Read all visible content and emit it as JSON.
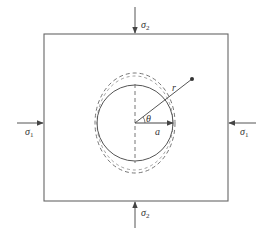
{
  "diagram": {
    "type": "stress-concentration-hole",
    "colors": {
      "line": "#555555",
      "background": "#ffffff",
      "text": "#333333"
    },
    "plate": {
      "x": 44,
      "y": 34,
      "width": 184,
      "height": 167
    },
    "hole": {
      "cx": 135,
      "cy": 123,
      "r": 38
    },
    "deformed_hole": {
      "cx": 135,
      "cy": 123,
      "rx": 40,
      "ry": 50,
      "style": "dashed"
    },
    "radius_point": {
      "x": 192,
      "y": 79
    },
    "labels": {
      "sigma2_top": {
        "symbol": "σ",
        "sub": "2"
      },
      "sigma2_bottom": {
        "symbol": "σ",
        "sub": "2"
      },
      "sigma1_left": {
        "symbol": "σ",
        "sub": "1"
      },
      "sigma1_right": {
        "symbol": "σ",
        "sub": "1"
      },
      "r": "r",
      "theta": "θ",
      "a": "a"
    }
  }
}
